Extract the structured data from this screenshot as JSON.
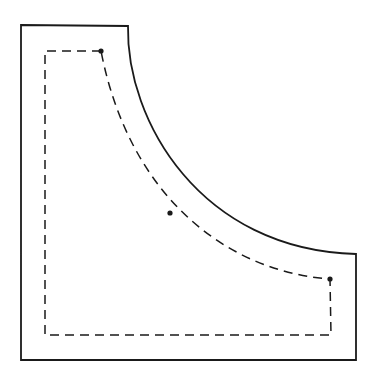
{
  "diagram": {
    "stroke_color": "#1a1a1a",
    "background": "#ffffff",
    "outer_outline": {
      "top_left": [
        21,
        25
      ],
      "top_right": [
        128,
        26
      ],
      "curve_end": [
        356,
        254
      ],
      "bottom_right": [
        356,
        360
      ],
      "bottom_left": [
        21,
        360
      ]
    },
    "inner_seam_line": {
      "style": "dashed",
      "top_left": [
        45,
        51
      ],
      "top_right": [
        101,
        51
      ],
      "curve_end": [
        330,
        279
      ],
      "bottom_right": [
        331,
        335
      ],
      "bottom_left": [
        45,
        335
      ]
    },
    "markers": [
      {
        "name": "top-dot",
        "x": 101,
        "y": 51
      },
      {
        "name": "middle-dot",
        "x": 170,
        "y": 213
      },
      {
        "name": "right-dot",
        "x": 330,
        "y": 279
      }
    ]
  }
}
